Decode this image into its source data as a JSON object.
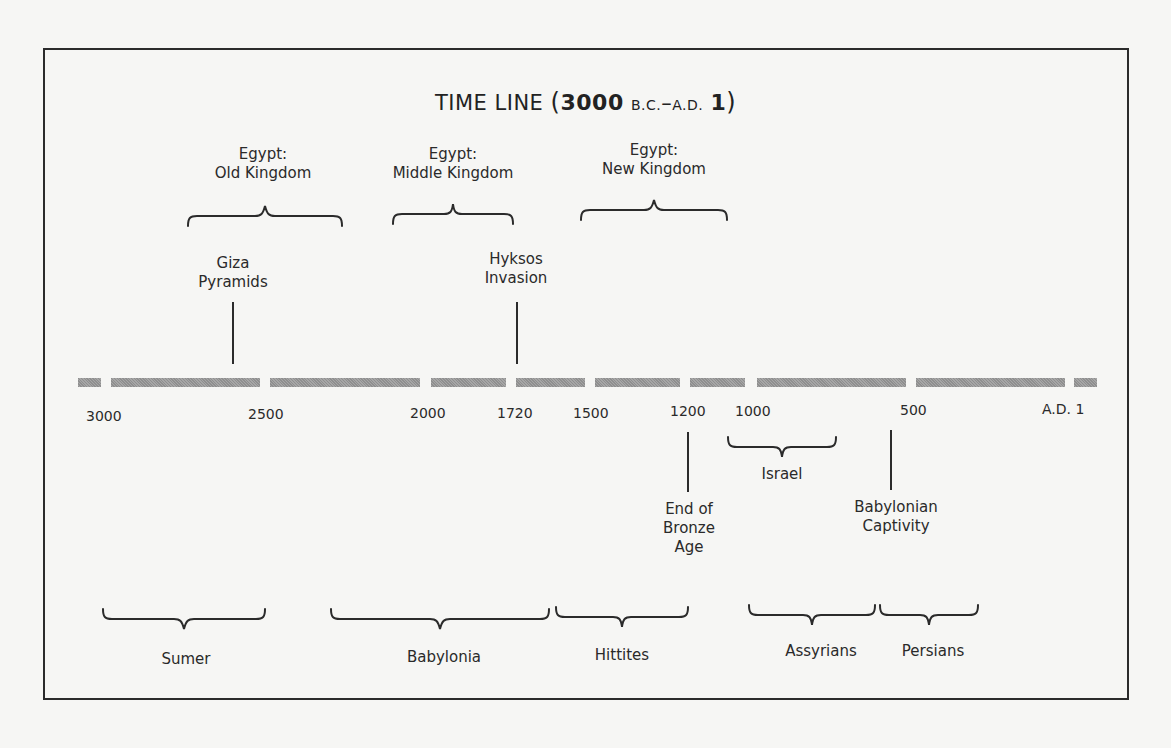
{
  "title": {
    "main": "TIME LINE",
    "open_paren": "(",
    "start_year": "3000",
    "start_era": "B.C.",
    "dash": "–",
    "end_era": "A.D.",
    "end_year": "1",
    "close_paren": ")"
  },
  "axis": {
    "ticks": [
      {
        "label": "3000"
      },
      {
        "label": "2500"
      },
      {
        "label": "2000"
      },
      {
        "label": "1720"
      },
      {
        "label": "1500"
      },
      {
        "label": "1200"
      },
      {
        "label": "1000"
      },
      {
        "label": "500"
      },
      {
        "label": "A.D. 1"
      }
    ],
    "bar_color": "#9a9a9a"
  },
  "periods_above": [
    {
      "line1": "Egypt:",
      "line2": "Old Kingdom"
    },
    {
      "line1": "Egypt:",
      "line2": "Middle Kingdom"
    },
    {
      "line1": "Egypt:",
      "line2": "New Kingdom"
    }
  ],
  "events_above": [
    {
      "line1": "Giza",
      "line2": "Pyramids"
    },
    {
      "line1": "Hyksos",
      "line2": "Invasion"
    }
  ],
  "events_below": [
    {
      "line1": "End of",
      "line2": "Bronze",
      "line3": "Age"
    },
    {
      "line1": "Babylonian",
      "line2": "Captivity"
    }
  ],
  "periods_below_near": [
    {
      "label": "Israel"
    }
  ],
  "periods_below": [
    {
      "label": "Sumer"
    },
    {
      "label": "Babylonia"
    },
    {
      "label": "Hittites"
    },
    {
      "label": "Assyrians"
    },
    {
      "label": "Persians"
    }
  ]
}
